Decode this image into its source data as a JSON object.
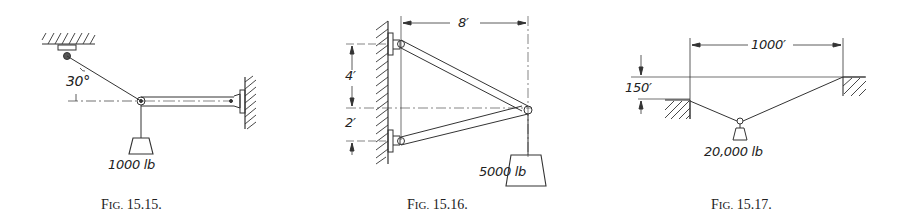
{
  "figures": [
    {
      "id": "15.15",
      "caption_prefix": "F",
      "caption_smallcaps": "IG.",
      "caption_number": "15.15.",
      "angle_label": "30°",
      "load_label": "1000 lb",
      "description": "Boom hinged to wall at right, supported by cable at 30° to horizontal from ceiling, load hanging from boom end"
    },
    {
      "id": "15.16",
      "caption_prefix": "F",
      "caption_smallcaps": "IG.",
      "caption_number": "15.16.",
      "dim_horizontal": "8′",
      "dim_upper": "4′",
      "dim_lower": "2′",
      "load_label": "5000 lb",
      "description": "Two-member bracket pinned to wall, joined at point 8 ft from wall, supporting load"
    },
    {
      "id": "15.17",
      "caption_prefix": "F",
      "caption_smallcaps": "IG.",
      "caption_number": "15.17.",
      "dim_span": "1000′",
      "dim_height": "150′",
      "load_label": "20,000 lb",
      "description": "Cable between two supports at different heights carrying a suspended load"
    }
  ]
}
